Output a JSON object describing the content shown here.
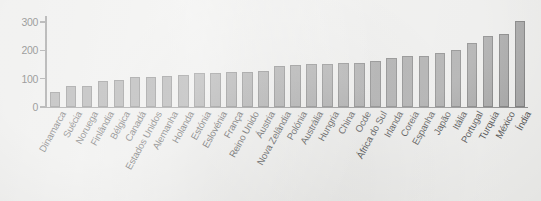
{
  "chart_data": {
    "type": "bar",
    "title": "",
    "subtitle": "",
    "xlabel": "",
    "ylabel": "",
    "ylim": [
      0,
      300
    ],
    "yticks": [
      0,
      100,
      200,
      300
    ],
    "ytick_labels": [
      "0",
      "100",
      "200",
      "300"
    ],
    "grid": false,
    "legend": null,
    "orientation": "vertical",
    "sorted": "ascending",
    "bar_color": "#8c8c8c",
    "bar_edge_color": "#5d5d5d",
    "background_color": "#e9e9e7",
    "axis_color": "#6f6f6f",
    "categories": [
      "Dinamarca",
      "Suécia",
      "Noruega",
      "Finlândia",
      "Bélgica",
      "Canadá",
      "Estados Unidos",
      "Alemanha",
      "Holanda",
      "Estónia",
      "Eslovénia",
      "França",
      "Reino Unido",
      "Áustria",
      "Nova Zelândia",
      "Polónia",
      "Austrália",
      "Hungria",
      "China",
      "Ocde",
      "África do Sul",
      "Irlanda",
      "Coreia",
      "Espanha",
      "Japão",
      "Itália",
      "Portugal",
      "Turquia",
      "México",
      "Índia"
    ],
    "values": [
      52,
      73,
      74,
      92,
      97,
      106,
      107,
      110,
      113,
      119,
      121,
      122,
      124,
      127,
      146,
      148,
      152,
      153,
      154,
      156,
      162,
      173,
      180,
      181,
      192,
      200,
      226,
      252,
      257,
      305
    ]
  }
}
